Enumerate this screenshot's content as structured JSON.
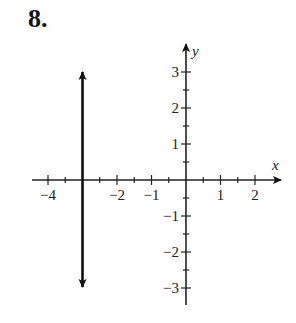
{
  "problem": {
    "number": "8."
  },
  "chart_data": {
    "type": "line",
    "title": "",
    "xlabel": "x",
    "ylabel": "y",
    "xlim": [
      -4.5,
      2.7
    ],
    "ylim": [
      -3.5,
      3.8
    ],
    "x_ticks": [
      -4,
      -3.5,
      -3,
      -2.5,
      -2,
      -1.5,
      -1,
      -0.5,
      0.5,
      1,
      1.5,
      2
    ],
    "x_tick_labels": [
      {
        "value": -4,
        "label": "−4"
      },
      {
        "value": -2,
        "label": "−2"
      },
      {
        "value": -1,
        "label": "−1"
      },
      {
        "value": 1,
        "label": "1"
      },
      {
        "value": 2,
        "label": "2"
      }
    ],
    "y_ticks": [
      -3,
      -2.5,
      -2,
      -1.5,
      -1,
      -0.5,
      0.5,
      1,
      1.5,
      2,
      2.5,
      3
    ],
    "y_tick_labels": [
      {
        "value": 3,
        "label": "3"
      },
      {
        "value": 2,
        "label": "2"
      },
      {
        "value": 1,
        "label": "1"
      },
      {
        "value": -1,
        "label": "−1"
      },
      {
        "value": -2,
        "label": "−2"
      },
      {
        "value": -3,
        "label": "−3"
      }
    ],
    "series": [
      {
        "name": "x = -3",
        "x": [
          -3,
          -3
        ],
        "y": [
          3,
          -3
        ],
        "arrows": "both",
        "color": "#111111"
      }
    ],
    "grid": false,
    "legend": null
  }
}
